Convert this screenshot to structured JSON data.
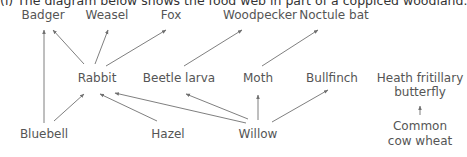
{
  "caption": "(i)  The diagram below shows the food web in part of a coppiced woodland.",
  "colors": {
    "text": "#555555",
    "arrow": "#707070",
    "background": "#ffffff"
  },
  "nodes": {
    "badger": "Badger",
    "weasel": "Weasel",
    "fox": "Fox",
    "woodpecker": "Woodpecker",
    "noctule_bat": "Noctule bat",
    "rabbit": "Rabbit",
    "beetle_larva": "Beetle larva",
    "moth": "Moth",
    "bullfinch": "Bullfinch",
    "heath_fritillary_line1": "Heath fritillary",
    "heath_fritillary_line2": "butterfly",
    "bluebell": "Bluebell",
    "hazel": "Hazel",
    "willow": "Willow",
    "cow_wheat_line1": "Common",
    "cow_wheat_line2": "cow wheat"
  },
  "edges": [
    {
      "from": "Bluebell",
      "to": "Badger"
    },
    {
      "from": "Bluebell",
      "to": "Rabbit"
    },
    {
      "from": "Rabbit",
      "to": "Badger"
    },
    {
      "from": "Rabbit",
      "to": "Weasel"
    },
    {
      "from": "Rabbit",
      "to": "Fox"
    },
    {
      "from": "Hazel",
      "to": "Rabbit"
    },
    {
      "from": "Willow",
      "to": "Rabbit"
    },
    {
      "from": "Willow",
      "to": "Beetle larva"
    },
    {
      "from": "Willow",
      "to": "Moth"
    },
    {
      "from": "Willow",
      "to": "Bullfinch"
    },
    {
      "from": "Beetle larva",
      "to": "Woodpecker"
    },
    {
      "from": "Moth",
      "to": "Noctule bat"
    },
    {
      "from": "Common cow wheat",
      "to": "Heath fritillary butterfly"
    }
  ]
}
